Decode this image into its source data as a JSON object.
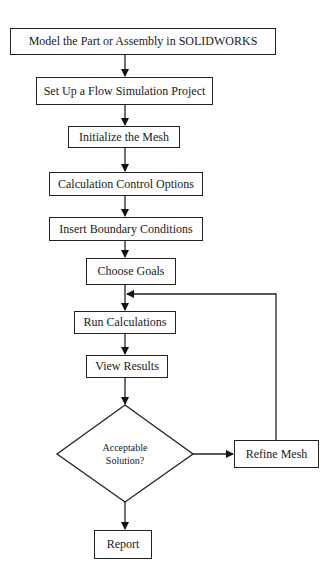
{
  "diagram": {
    "type": "flowchart",
    "nodes": [
      {
        "id": "model",
        "label": "Model the Part or Assembly in SOLIDWORKS",
        "shape": "rect"
      },
      {
        "id": "setup",
        "label": "Set Up a Flow Simulation Project",
        "shape": "rect"
      },
      {
        "id": "mesh",
        "label": "Initialize the Mesh",
        "shape": "rect"
      },
      {
        "id": "calc_control",
        "label": "Calculation Control Options",
        "shape": "rect"
      },
      {
        "id": "boundary",
        "label": "Insert Boundary Conditions",
        "shape": "rect"
      },
      {
        "id": "goals",
        "label": "Choose Goals",
        "shape": "rect"
      },
      {
        "id": "run",
        "label": "Run Calculations",
        "shape": "rect"
      },
      {
        "id": "view",
        "label": "View Results",
        "shape": "rect"
      },
      {
        "id": "decision",
        "label_line1": "Acceptable",
        "label_line2": "Solution?",
        "shape": "diamond"
      },
      {
        "id": "refine",
        "label": "Refine Mesh",
        "shape": "rect"
      },
      {
        "id": "report",
        "label": "Report",
        "shape": "rect"
      }
    ],
    "edges": [
      {
        "from": "model",
        "to": "setup"
      },
      {
        "from": "setup",
        "to": "mesh"
      },
      {
        "from": "mesh",
        "to": "calc_control"
      },
      {
        "from": "calc_control",
        "to": "boundary"
      },
      {
        "from": "boundary",
        "to": "goals"
      },
      {
        "from": "goals",
        "to": "run"
      },
      {
        "from": "run",
        "to": "view"
      },
      {
        "from": "view",
        "to": "decision"
      },
      {
        "from": "decision",
        "to": "refine"
      },
      {
        "from": "refine",
        "to": "run"
      },
      {
        "from": "decision",
        "to": "report"
      }
    ]
  }
}
